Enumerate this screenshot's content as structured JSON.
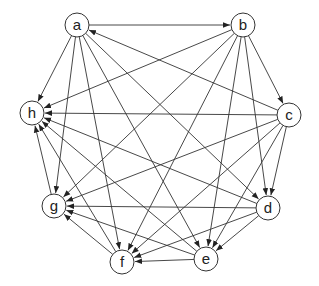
{
  "diagram": {
    "type": "directed-graph",
    "nodes": [
      {
        "id": "a",
        "label": "a",
        "x": 77,
        "y": 25
      },
      {
        "id": "b",
        "label": "b",
        "x": 243,
        "y": 25
      },
      {
        "id": "c",
        "label": "c",
        "x": 289,
        "y": 115
      },
      {
        "id": "d",
        "label": "d",
        "x": 268,
        "y": 208
      },
      {
        "id": "e",
        "label": "e",
        "x": 206,
        "y": 259
      },
      {
        "id": "f",
        "label": "f",
        "x": 122,
        "y": 262
      },
      {
        "id": "g",
        "label": "g",
        "x": 54,
        "y": 206
      },
      {
        "id": "h",
        "label": "h",
        "x": 32,
        "y": 113
      }
    ],
    "node_radius": 12,
    "edges": [
      [
        "a",
        "b"
      ],
      [
        "c",
        "a"
      ],
      [
        "a",
        "h"
      ],
      [
        "a",
        "g"
      ],
      [
        "a",
        "f"
      ],
      [
        "a",
        "e"
      ],
      [
        "a",
        "d"
      ],
      [
        "b",
        "c"
      ],
      [
        "b",
        "h"
      ],
      [
        "b",
        "g"
      ],
      [
        "b",
        "f"
      ],
      [
        "b",
        "e"
      ],
      [
        "b",
        "d"
      ],
      [
        "c",
        "h"
      ],
      [
        "c",
        "g"
      ],
      [
        "c",
        "f"
      ],
      [
        "c",
        "e"
      ],
      [
        "c",
        "d"
      ],
      [
        "d",
        "h"
      ],
      [
        "d",
        "g"
      ],
      [
        "d",
        "f"
      ],
      [
        "d",
        "e"
      ],
      [
        "e",
        "h"
      ],
      [
        "e",
        "g"
      ],
      [
        "e",
        "f"
      ],
      [
        "f",
        "g"
      ],
      [
        "f",
        "h"
      ],
      [
        "g",
        "h"
      ]
    ],
    "colors": {
      "stroke": "#333333",
      "background": "#ffffff",
      "text": "#222222"
    }
  }
}
